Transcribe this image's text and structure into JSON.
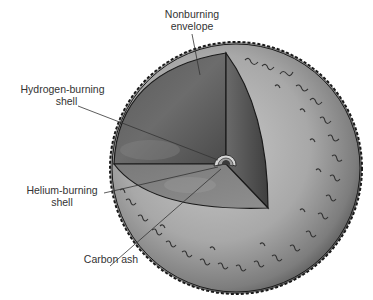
{
  "figure": {
    "labels": {
      "nonburning_envelope": [
        "Nonburning",
        "envelope"
      ],
      "hydrogen_shell": [
        "Hydrogen-burning",
        "shell"
      ],
      "helium_shell": [
        "Helium-burning",
        "shell"
      ],
      "carbon_ash": [
        "Carbon ash"
      ]
    },
    "colors": {
      "background": "#ffffff",
      "outer_surface": "#9a9a9a",
      "cutaway_dark": "#4a4a4a",
      "cutaway_mid": "#6e6e6e",
      "cutaway_light": "#8c8c8c",
      "hydrogen_shell": "#d8d8d8",
      "helium_shell": "#a0a0a0",
      "carbon_core": "#3a3a3a",
      "outline": "#1a1a1a",
      "label_text": "#333333"
    }
  }
}
